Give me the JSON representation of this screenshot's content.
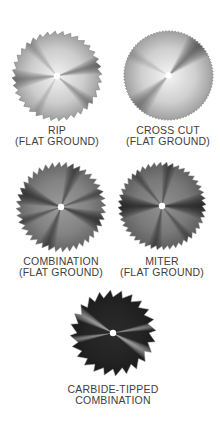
{
  "blades": [
    {
      "id": "rip",
      "label_line1": "RIP",
      "label_line2": "(FLAT GROUND)",
      "cx": 57,
      "cy": 76,
      "r": 45,
      "teeth": 36,
      "tooth_depth": 4,
      "base_color": "#f1f1f1",
      "shade_color": "#444444",
      "rays": [
        {
          "angle": 175,
          "spread": 14,
          "opacity": 0.55
        },
        {
          "angle": 345,
          "spread": 12,
          "opacity": 0.65
        },
        {
          "angle": 40,
          "spread": 10,
          "opacity": 0.45
        },
        {
          "angle": 230,
          "spread": 10,
          "opacity": 0.25
        },
        {
          "angle": 120,
          "spread": 8,
          "opacity": 0.2
        }
      ],
      "caption_x": 57,
      "caption_y": 125
    },
    {
      "id": "cross-cut",
      "label_line1": "CROSS CUT",
      "label_line2": "(FLAT GROUND)",
      "cx": 168,
      "cy": 75,
      "r": 45,
      "teeth": 90,
      "tooth_depth": 1.5,
      "base_color": "#f4f4f4",
      "shade_color": "#333333",
      "rays": [
        {
          "angle": 315,
          "spread": 18,
          "opacity": 0.7
        },
        {
          "angle": 135,
          "spread": 16,
          "opacity": 0.45
        },
        {
          "angle": 210,
          "spread": 10,
          "opacity": 0.15
        }
      ],
      "caption_x": 168,
      "caption_y": 125
    },
    {
      "id": "combination",
      "label_line1": "COMBINATION",
      "label_line2": "(FLAT GROUND)",
      "cx": 61,
      "cy": 207,
      "r": 45,
      "teeth": 40,
      "tooth_depth": 5,
      "base_color": "#9a9a9a",
      "shade_color": "#1c1c1c",
      "rays": [
        {
          "angle": 200,
          "spread": 16,
          "opacity": 0.85
        },
        {
          "angle": 20,
          "spread": 14,
          "opacity": 0.85
        },
        {
          "angle": 110,
          "spread": 12,
          "opacity": 0.6
        },
        {
          "angle": 290,
          "spread": 12,
          "opacity": 0.6
        },
        {
          "angle": 160,
          "spread": 8,
          "opacity": 0.5
        },
        {
          "angle": 340,
          "spread": 8,
          "opacity": 0.5
        }
      ],
      "caption_x": 61,
      "caption_y": 256
    },
    {
      "id": "miter",
      "label_line1": "MITER",
      "label_line2": "(FLAT GROUND)",
      "cx": 162,
      "cy": 206,
      "r": 44,
      "teeth": 44,
      "tooth_depth": 4,
      "base_color": "#8f8f8f",
      "shade_color": "#111111",
      "rays": [
        {
          "angle": 180,
          "spread": 18,
          "opacity": 0.95
        },
        {
          "angle": 0,
          "spread": 18,
          "opacity": 0.95
        },
        {
          "angle": 100,
          "spread": 10,
          "opacity": 0.55
        },
        {
          "angle": 280,
          "spread": 10,
          "opacity": 0.55
        },
        {
          "angle": 230,
          "spread": 8,
          "opacity": 0.4
        },
        {
          "angle": 50,
          "spread": 8,
          "opacity": 0.4
        }
      ],
      "caption_x": 162,
      "caption_y": 256
    },
    {
      "id": "carbide-tipped",
      "label_line1": "CARBIDE-TIPPED",
      "label_line2": "COMBINATION",
      "cx": 113,
      "cy": 333,
      "r": 43,
      "teeth": 24,
      "tooth_depth": 7,
      "base_color": "#2a2a2a",
      "shade_color": "#ffffff",
      "rays": [
        {
          "angle": 210,
          "spread": 10,
          "opacity": 0.9
        },
        {
          "angle": 30,
          "spread": 10,
          "opacity": 0.9
        },
        {
          "angle": 170,
          "spread": 6,
          "opacity": 0.7
        },
        {
          "angle": 350,
          "spread": 6,
          "opacity": 0.7
        }
      ],
      "caption_x": 113,
      "caption_y": 384
    }
  ]
}
